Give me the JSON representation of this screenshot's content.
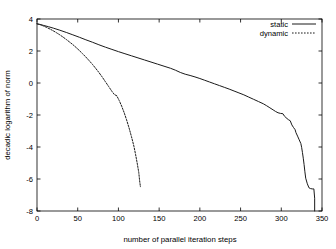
{
  "chart_data": {
    "type": "line",
    "title": "",
    "xlabel": "number of parallel iteration steps",
    "ylabel": "decadic logarithm of norm",
    "xlim": [
      0,
      350
    ],
    "ylim": [
      -8,
      4
    ],
    "xticks": [
      0,
      50,
      100,
      150,
      200,
      250,
      300,
      350
    ],
    "yticks": [
      4,
      2,
      0,
      -2,
      -4,
      -6,
      -8
    ],
    "xtick_labels": [
      "0",
      "50",
      "100",
      "150",
      "200",
      "250",
      "300",
      "350"
    ],
    "ytick_labels": [
      "4",
      "2",
      "0",
      "-2",
      "-4",
      "-6",
      "-8"
    ],
    "grid": false,
    "legend_position": "top-right",
    "series": [
      {
        "name": "static",
        "style": "solid",
        "color": "#1a1a1a",
        "points": [
          [
            0,
            3.7
          ],
          [
            4,
            3.66
          ],
          [
            8,
            3.6
          ],
          [
            14,
            3.52
          ],
          [
            20,
            3.43
          ],
          [
            28,
            3.3
          ],
          [
            36,
            3.16
          ],
          [
            44,
            3.01
          ],
          [
            52,
            2.86
          ],
          [
            60,
            2.7
          ],
          [
            68,
            2.55
          ],
          [
            76,
            2.39
          ],
          [
            84,
            2.24
          ],
          [
            92,
            2.1
          ],
          [
            100,
            1.96
          ],
          [
            108,
            1.83
          ],
          [
            116,
            1.7
          ],
          [
            124,
            1.57
          ],
          [
            132,
            1.44
          ],
          [
            140,
            1.31
          ],
          [
            148,
            1.18
          ],
          [
            156,
            1.05
          ],
          [
            164,
            0.92
          ],
          [
            170,
            0.8
          ],
          [
            176,
            0.66
          ],
          [
            182,
            0.55
          ],
          [
            188,
            0.47
          ],
          [
            194,
            0.38
          ],
          [
            200,
            0.28
          ],
          [
            206,
            0.17
          ],
          [
            212,
            0.06
          ],
          [
            218,
            -0.05
          ],
          [
            224,
            -0.16
          ],
          [
            230,
            -0.27
          ],
          [
            236,
            -0.38
          ],
          [
            242,
            -0.5
          ],
          [
            248,
            -0.62
          ],
          [
            254,
            -0.74
          ],
          [
            260,
            -0.88
          ],
          [
            266,
            -1.02
          ],
          [
            272,
            -1.16
          ],
          [
            278,
            -1.3
          ],
          [
            282,
            -1.42
          ],
          [
            286,
            -1.55
          ],
          [
            290,
            -1.68
          ],
          [
            293,
            -1.78
          ],
          [
            296,
            -1.86
          ],
          [
            299,
            -1.9
          ],
          [
            302,
            -1.92
          ],
          [
            304,
            -2.08
          ],
          [
            307,
            -2.22
          ],
          [
            309,
            -2.3
          ],
          [
            311,
            -2.36
          ],
          [
            313,
            -2.62
          ],
          [
            315,
            -2.78
          ],
          [
            317,
            -2.92
          ],
          [
            318,
            -3.1
          ],
          [
            320,
            -3.32
          ],
          [
            322,
            -3.55
          ],
          [
            324,
            -3.78
          ],
          [
            325,
            -4.02
          ],
          [
            326,
            -4.35
          ],
          [
            327,
            -4.7
          ],
          [
            328,
            -5.1
          ],
          [
            329,
            -5.55
          ],
          [
            330,
            -5.95
          ],
          [
            332,
            -6.3
          ],
          [
            334,
            -6.55
          ],
          [
            336,
            -6.6
          ],
          [
            338,
            -6.62
          ],
          [
            340,
            -6.62
          ],
          [
            341,
            -7.2
          ],
          [
            341,
            -8.0
          ]
        ]
      },
      {
        "name": "dynamic",
        "style": "dotted",
        "color": "#1a1a1a",
        "points": [
          [
            0,
            3.7
          ],
          [
            4,
            3.64
          ],
          [
            8,
            3.56
          ],
          [
            12,
            3.47
          ],
          [
            16,
            3.37
          ],
          [
            20,
            3.26
          ],
          [
            24,
            3.14
          ],
          [
            28,
            3.01
          ],
          [
            32,
            2.87
          ],
          [
            36,
            2.72
          ],
          [
            40,
            2.56
          ],
          [
            44,
            2.4
          ],
          [
            48,
            2.22
          ],
          [
            52,
            2.03
          ],
          [
            56,
            1.83
          ],
          [
            60,
            1.62
          ],
          [
            64,
            1.4
          ],
          [
            68,
            1.17
          ],
          [
            72,
            0.92
          ],
          [
            76,
            0.66
          ],
          [
            80,
            0.38
          ],
          [
            84,
            0.08
          ],
          [
            88,
            -0.22
          ],
          [
            92,
            -0.52
          ],
          [
            95,
            -0.72
          ],
          [
            98,
            -0.8
          ],
          [
            101,
            -1.1
          ],
          [
            104,
            -1.45
          ],
          [
            107,
            -1.85
          ],
          [
            110,
            -2.3
          ],
          [
            113,
            -2.8
          ],
          [
            116,
            -3.35
          ],
          [
            119,
            -3.95
          ],
          [
            121,
            -4.45
          ],
          [
            123,
            -5.0
          ],
          [
            125,
            -5.6
          ],
          [
            126,
            -6.1
          ],
          [
            127,
            -6.48
          ]
        ]
      }
    ]
  },
  "legend": {
    "entries": [
      {
        "label": "static"
      },
      {
        "label": "dynamic"
      }
    ]
  }
}
